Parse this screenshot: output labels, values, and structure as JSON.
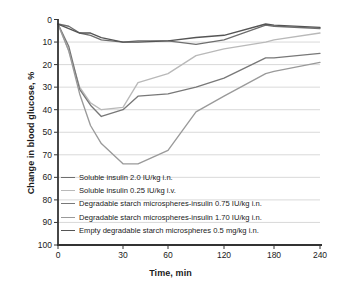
{
  "chart_data": {
    "type": "line",
    "title": "",
    "xlabel": "Time, min",
    "ylabel": "Change in blood glucose, %",
    "grid": true,
    "legend_position": "inside-lower-left",
    "y_inverted": true,
    "xlim": [
      0,
      240
    ],
    "ylim": [
      0,
      100
    ],
    "x_tick_labels": [
      "0",
      "30",
      "60",
      "120",
      "180",
      "240"
    ],
    "x_tick_values": [
      0,
      30,
      60,
      120,
      180,
      240
    ],
    "y_tick_labels": [
      "0",
      "10",
      "20",
      "30",
      "40",
      "50",
      "70",
      "60",
      "80",
      "90",
      "100"
    ],
    "y_tick_values": [
      0,
      10,
      20,
      30,
      40,
      50,
      60,
      70,
      80,
      90,
      100
    ],
    "x": [
      0,
      5,
      10,
      15,
      20,
      30,
      40,
      60,
      90,
      120,
      170,
      180,
      240
    ],
    "series": [
      {
        "name": "Soluble insulin 2.0 IU/kg i.n.",
        "color": "#6e6e6e",
        "values": [
          2,
          3,
          6,
          7,
          9,
          10,
          9.5,
          9.5,
          11,
          9,
          2.5,
          3,
          4
        ]
      },
      {
        "name": "Soluble insulin 0.25 IU/kg i.v.",
        "color": "#b9b9b9",
        "values": [
          2,
          14,
          30,
          37,
          40,
          39,
          28,
          24,
          16,
          13,
          10,
          9,
          6
        ]
      },
      {
        "name": "Degradable starch microspheres-insulin 0.75 IU/kg i.n.",
        "color": "#787878",
        "values": [
          2,
          12,
          31,
          38,
          43,
          40,
          34,
          33,
          30,
          26,
          17,
          17,
          15
        ]
      },
      {
        "name": "Degradable starch microspheres-insulin 1.70 IU/kg i.n.",
        "color": "#9a9a9a",
        "values": [
          2,
          14,
          33,
          47,
          55,
          64,
          64,
          58,
          41,
          34,
          24,
          23,
          19
        ]
      },
      {
        "name": "Empty degradable starch microspheres 0.5 mg/kg i.n.",
        "color": "#555555",
        "values": [
          2,
          4,
          6,
          6,
          8,
          10,
          10,
          9.5,
          8,
          7,
          2,
          2.5,
          3.5
        ]
      }
    ]
  }
}
